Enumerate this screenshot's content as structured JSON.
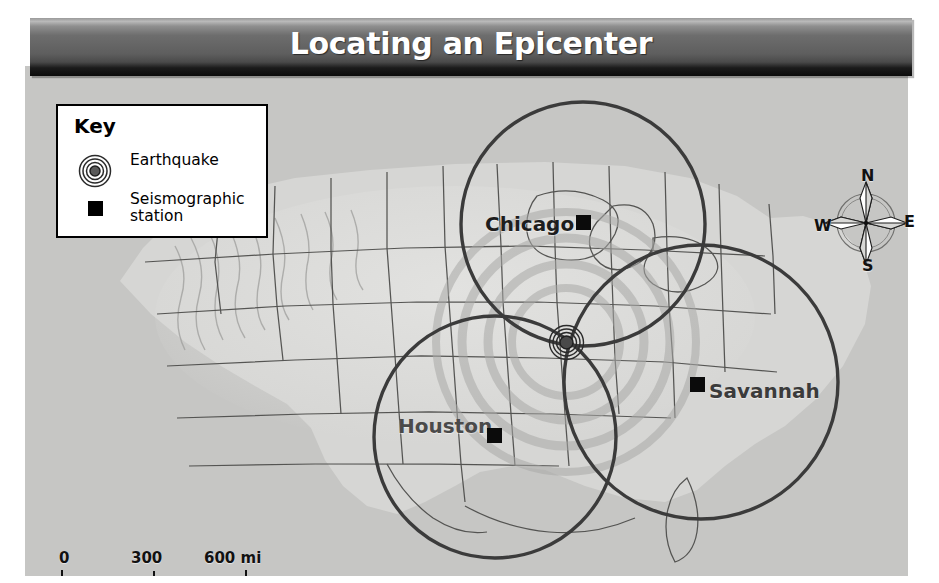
{
  "title": "Locating an Epicenter",
  "key": {
    "heading": "Key",
    "items": [
      {
        "icon": "earthquake-rings-icon",
        "label": "Earthquake"
      },
      {
        "icon": "seismographic-station-square-icon",
        "label": "Seismographic\nstation"
      }
    ]
  },
  "cities": [
    {
      "name": "Chicago",
      "marker": "seismographic-station"
    },
    {
      "name": "Houston",
      "marker": "seismographic-station"
    },
    {
      "name": "Savannah",
      "marker": "seismographic-station"
    }
  ],
  "compass": {
    "north": "N",
    "east": "E",
    "south": "S",
    "west": "W"
  },
  "scale": {
    "miles": {
      "ticks": [
        "0",
        "300",
        "600 mi"
      ]
    },
    "kilometers": {
      "ticks": [
        "0",
        "300",
        "600 km"
      ]
    }
  },
  "colors": {
    "banner_light": "#b9b9b9",
    "banner_mid": "#5e5e5e",
    "banner_dark": "#0c0c0c",
    "title_text": "#ffffff",
    "map_base": "#c9c9c7",
    "circle_stroke": "#3b3b3b",
    "state_border": "#4a4a4a",
    "marker_fill": "#0b0b0b",
    "key_border": "#000000",
    "key_background": "#ffffff"
  },
  "map_geometry": {
    "circles": [
      {
        "station": "Chicago",
        "cx": 583,
        "cy": 224,
        "r": 122
      },
      {
        "station": "Houston",
        "cx": 495,
        "cy": 437,
        "r": 121
      },
      {
        "station": "Savannah",
        "cx": 701,
        "cy": 382,
        "r": 137
      }
    ],
    "epicenter": {
      "x": 566,
      "y": 342
    }
  }
}
